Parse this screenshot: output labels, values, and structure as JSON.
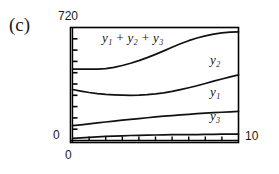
{
  "figure": {
    "panel_label": "(c)",
    "y_axis_max_label": "720",
    "y_axis_min_label": "0",
    "x_axis_min_label": "0",
    "x_axis_max_label": "10"
  },
  "labels": {
    "sum_curve": "y₁ + y₂ + y₃",
    "y2_curve": "y₂",
    "y1_curve": "y₁",
    "y3_curve": "y₃"
  },
  "colors": {
    "axis": "#000000",
    "curve": "#111111",
    "background": "#ffffff"
  },
  "chart_data": {
    "type": "line",
    "title": "(c)",
    "xlabel": "",
    "ylabel": "",
    "xlim": [
      0,
      10
    ],
    "ylim": [
      0,
      720
    ],
    "grid": false,
    "legend": "inline-annotations",
    "x": [
      0,
      0.5,
      1,
      1.5,
      2,
      2.5,
      3,
      3.5,
      4,
      4.5,
      5,
      5.5,
      6,
      6.5,
      7,
      7.5,
      8,
      8.5,
      9,
      9.5,
      10
    ],
    "series": [
      {
        "name": "y₁ + y₂ + y₃",
        "values": [
          455,
          455,
          455,
          455,
          458,
          466,
          478,
          492,
          509,
          528,
          549,
          571,
          594,
          616,
          636,
          653,
          667,
          678,
          686,
          690,
          692
        ]
      },
      {
        "name": "y₂",
        "values": [
          325,
          315,
          306,
          299,
          294,
          291,
          289,
          288,
          289,
          292,
          297,
          304,
          313,
          324,
          336,
          349,
          363,
          378,
          392,
          405,
          418
        ]
      },
      {
        "name": "y₁",
        "values": [
          95,
          100,
          106,
          112,
          118,
          124,
          130,
          135,
          140,
          145,
          150,
          155,
          159,
          163,
          167,
          171,
          174,
          177,
          180,
          183,
          185
        ]
      },
      {
        "name": "y₃",
        "values": [
          14,
          17,
          20,
          23,
          26,
          28,
          30,
          32,
          33,
          34,
          35,
          36,
          37,
          37,
          38,
          38,
          39,
          39,
          40,
          40,
          40
        ]
      }
    ],
    "y_ticks_count": 9,
    "x_ticks_count": 10
  }
}
